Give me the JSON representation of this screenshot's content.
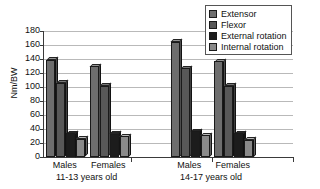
{
  "chart_data": {
    "type": "bar",
    "title": "",
    "subtitle": "",
    "xlabel": "",
    "ylabel": "Nm/BW",
    "ylim": [
      0,
      180
    ],
    "ytick_step": 20,
    "yticks": [
      180,
      160,
      140,
      120,
      100,
      80,
      60,
      40,
      20,
      0
    ],
    "grid": true,
    "legend_position": "top-right",
    "categories": [
      "Males",
      "Females",
      "Males",
      "Females"
    ],
    "group_labels": [
      "11-13 years old",
      "14-17 years old"
    ],
    "groups": [
      {
        "group_label": "11-13 years old",
        "categories": [
          "Males",
          "Females"
        ]
      },
      {
        "group_label": "14-17 years old",
        "categories": [
          "Males",
          "Females"
        ]
      }
    ],
    "series": [
      {
        "name": "Extensor",
        "color": "#6e6e6e",
        "values": [
          139,
          130,
          165,
          137
        ]
      },
      {
        "name": "Flexor",
        "color": "#585858",
        "values": [
          106,
          102,
          127,
          102
        ]
      },
      {
        "name": "External rotation",
        "color": "#1c1c1c",
        "values": [
          34,
          33,
          37,
          34
        ]
      },
      {
        "name": "Internal rotation",
        "color": "#8a8a8a",
        "values": [
          26,
          30,
          31,
          25
        ]
      }
    ]
  },
  "legend": {
    "items": [
      {
        "label": "Extensor",
        "color": "#6e6e6e"
      },
      {
        "label": "Flexor",
        "color": "#585858"
      },
      {
        "label": "External rotation",
        "color": "#1c1c1c"
      },
      {
        "label": "Internal rotation",
        "color": "#8a8a8a"
      }
    ]
  },
  "axis": {
    "y_title": "Nm/BW"
  }
}
